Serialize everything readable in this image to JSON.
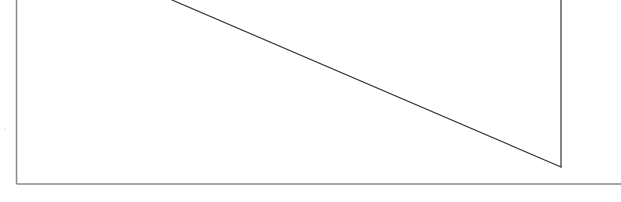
{
  "diagram": {
    "type": "geometric-line-figure",
    "caption": "",
    "canvas": {
      "width": 621,
      "height": 202,
      "background": "#ffffff"
    },
    "frame": {
      "color": "#8a8a8a",
      "stroke_width": 1.5,
      "left_edge": {
        "x": 16.5,
        "y1": 0,
        "y2": 184
      },
      "bottom_edge": {
        "y": 184,
        "x1": 16.5,
        "x2": 621
      }
    },
    "lines": [
      {
        "id": "diagonal",
        "x1": 172,
        "y1": 0,
        "x2": 561,
        "y2": 167,
        "color": "#333333",
        "stroke_width": 1.2
      },
      {
        "id": "vertical-right",
        "x1": 561,
        "y1": 0,
        "x2": 561,
        "y2": 167,
        "color": "#333333",
        "stroke_width": 1.2
      }
    ],
    "stray_marks": [
      {
        "x": 5,
        "y": 129,
        "color": "#bbbbbb"
      }
    ]
  }
}
